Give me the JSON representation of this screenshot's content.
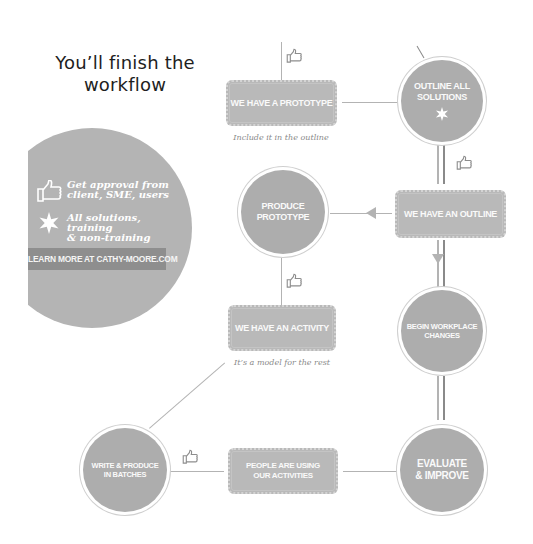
{
  "title": {
    "line1": "You’ll finish the",
    "line2": "workflow"
  },
  "legend": {
    "items": [
      {
        "icon": "thumbs-up-icon",
        "text_line1": "Get approval from",
        "text_line2": "client, SME, users"
      },
      {
        "icon": "star-icon",
        "text_line1": "All solutions, training",
        "text_line2": "& non-training"
      }
    ],
    "banner": "LEARN MORE AT CATHY-MOORE.COM"
  },
  "nodes": {
    "outline_all_solutions": {
      "shape": "circle",
      "line1": "OUTLINE ALL",
      "line2": "SOLUTIONS",
      "icon": "star-icon"
    },
    "we_have_a_prototype": {
      "shape": "box",
      "label": "WE HAVE A PROTOTYPE",
      "caption": "Include it in the outline"
    },
    "we_have_an_outline": {
      "shape": "box",
      "label": "WE HAVE AN OUTLINE"
    },
    "produce_prototype": {
      "shape": "circle",
      "line1": "PRODUCE",
      "line2": "PROTOTYPE"
    },
    "we_have_an_activity": {
      "shape": "box",
      "label": "WE HAVE AN ACTIVITY",
      "caption": "It’s a model for the rest"
    },
    "begin_workplace_changes": {
      "shape": "circle",
      "line1": "BEGIN WORKPLACE",
      "line2": "CHANGES"
    },
    "write_produce_batches": {
      "shape": "circle",
      "line1": "WRITE & PRODUCE",
      "line2": "IN BATCHES"
    },
    "people_using_activities": {
      "shape": "box",
      "line1": "PEOPLE ARE USING",
      "line2": "OUR ACTIVITIES"
    },
    "evaluate_improve": {
      "shape": "circle",
      "line1": "EVALUATE",
      "line2": "& IMPROVE"
    }
  },
  "colors": {
    "node_fill": "#adadad",
    "box_fill": "#b9b9b9",
    "side_panel": "#b4b4b4",
    "banner": "#8e8e8e",
    "connector": "#b3b3b3",
    "connector_dark": "#8a8a8a",
    "title_text": "#1e1e1e"
  }
}
